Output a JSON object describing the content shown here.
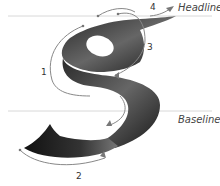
{
  "diagram": {
    "guides": {
      "headline_label": "Headline",
      "baseline_label": "Baseline"
    },
    "steps": [
      {
        "label": "1"
      },
      {
        "label": "2"
      },
      {
        "label": "3"
      },
      {
        "label": "4"
      }
    ],
    "colors": {
      "stroke_dark": "#1a1a1a",
      "stroke_mid": "#555555",
      "guide_line": "#cccccc",
      "arrow": "#777777",
      "text": "#333333"
    }
  }
}
